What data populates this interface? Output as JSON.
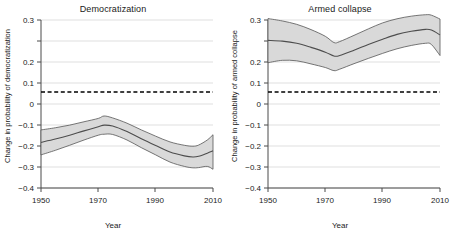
{
  "figure": {
    "width": 453,
    "height": 233,
    "background": "#ffffff"
  },
  "panels": [
    {
      "key": "democratization",
      "title": "Democratization",
      "xlabel": "Year",
      "ylabel": "Change in probability of democratization"
    },
    {
      "key": "armed_collapse",
      "title": "Armed collapse",
      "xlabel": "Year",
      "ylabel": "Change in probability of armed collapse"
    }
  ],
  "axis": {
    "y_ticks": [
      "0.3",
      "0.2",
      "0.1",
      "0",
      "−0.1",
      "−0.2",
      "−0.3",
      "−0.4"
    ],
    "y_tick_values": [
      0.3,
      0.2,
      0.1,
      0,
      -0.1,
      -0.2,
      -0.3,
      -0.4
    ],
    "x_ticks": [
      "1950",
      "1970",
      "1990",
      "2010"
    ],
    "x_tick_values": [
      1950,
      1970,
      1990,
      2010
    ],
    "ylim": [
      -0.4,
      0.3
    ],
    "xlim": [
      1950,
      2010
    ],
    "zero_reference_line": 0,
    "zero_line_style": "dashed",
    "grid": "horizontal-light"
  },
  "colors": {
    "line": "#4d4d4d",
    "band_fill": "#d9d9d9",
    "band_edge": "#555555",
    "grid": "#c9c9c9",
    "axis": "#4a4a4a",
    "zero_line": "#000000",
    "text": "#1a1a1a"
  },
  "chart_data": [
    {
      "type": "line",
      "title": "Democratization",
      "xlabel": "Year",
      "ylabel": "Change in probability of democratization",
      "xlim": [
        1950,
        2010
      ],
      "ylim": [
        -0.4,
        0.3
      ],
      "grid": true,
      "legend": "none",
      "annotations": [
        {
          "text": "dashed horizontal reference line at 0",
          "y": 0
        }
      ],
      "x": [
        1950,
        1955,
        1960,
        1965,
        1970,
        1972,
        1975,
        1980,
        1985,
        1990,
        1995,
        2000,
        2003,
        2005,
        2008,
        2010
      ],
      "series": [
        {
          "name": "mean",
          "values": [
            -0.21,
            -0.196,
            -0.18,
            -0.162,
            -0.145,
            -0.138,
            -0.142,
            -0.165,
            -0.195,
            -0.223,
            -0.25,
            -0.266,
            -0.271,
            -0.268,
            -0.255,
            -0.245
          ]
        },
        {
          "name": "ci_upper",
          "values": [
            -0.158,
            -0.149,
            -0.138,
            -0.124,
            -0.11,
            -0.1,
            -0.108,
            -0.13,
            -0.158,
            -0.184,
            -0.208,
            -0.222,
            -0.226,
            -0.221,
            -0.2,
            -0.178
          ]
        },
        {
          "name": "ci_lower",
          "values": [
            -0.262,
            -0.243,
            -0.222,
            -0.2,
            -0.18,
            -0.176,
            -0.177,
            -0.2,
            -0.232,
            -0.262,
            -0.292,
            -0.31,
            -0.316,
            -0.315,
            -0.31,
            -0.322
          ]
        }
      ]
    },
    {
      "type": "line",
      "title": "Armed collapse",
      "xlabel": "Year",
      "ylabel": "Change in probability of armed collapse",
      "xlim": [
        1950,
        2010
      ],
      "ylim": [
        -0.4,
        0.3
      ],
      "grid": true,
      "legend": "none",
      "annotations": [
        {
          "text": "dashed horizontal reference line at 0",
          "y": 0
        }
      ],
      "x": [
        1950,
        1955,
        1960,
        1965,
        1970,
        1973,
        1975,
        1980,
        1985,
        1990,
        1995,
        2000,
        2005,
        2007,
        2010
      ],
      "series": [
        {
          "name": "mean",
          "values": [
            0.215,
            0.212,
            0.203,
            0.186,
            0.166,
            0.15,
            0.152,
            0.174,
            0.198,
            0.22,
            0.24,
            0.253,
            0.261,
            0.258,
            0.238
          ]
        },
        {
          "name": "ci_upper",
          "values": [
            0.306,
            0.296,
            0.282,
            0.26,
            0.232,
            0.206,
            0.21,
            0.236,
            0.263,
            0.288,
            0.305,
            0.316,
            0.322,
            0.32,
            0.304
          ]
        },
        {
          "name": "ci_lower",
          "values": [
            0.122,
            0.132,
            0.13,
            0.117,
            0.102,
            0.089,
            0.095,
            0.118,
            0.14,
            0.161,
            0.18,
            0.194,
            0.203,
            0.198,
            0.152
          ]
        }
      ]
    }
  ]
}
